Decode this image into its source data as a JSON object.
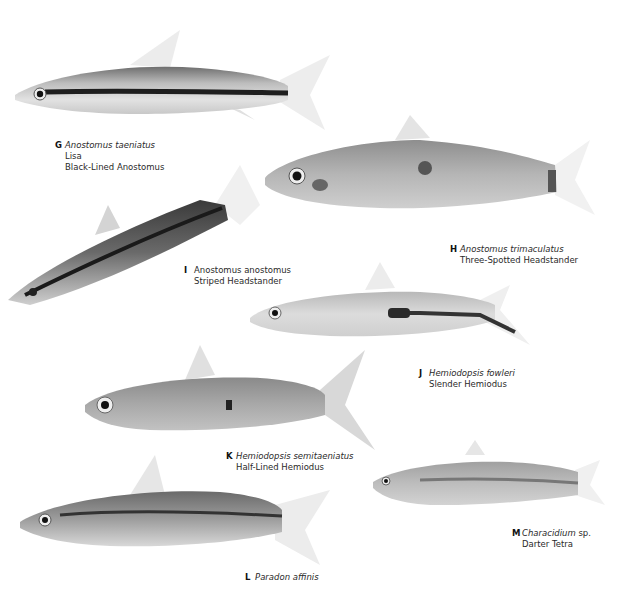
{
  "plate": {
    "specimens": [
      {
        "letter": "G",
        "scientific": "Anostomus taeniatus",
        "common": [
          "Lisa",
          "Black-Lined Anostomus"
        ]
      },
      {
        "letter": "H",
        "scientific": "Anostomus trimaculatus",
        "common": [
          "Three-Spotted Headstander"
        ]
      },
      {
        "letter": "I",
        "scientific": "Anostomus anostomus",
        "common": [
          "Striped Headstander"
        ]
      },
      {
        "letter": "J",
        "scientific": "Hemiodopsis fowleri",
        "common": [
          "Slender Hemiodus"
        ]
      },
      {
        "letter": "K",
        "scientific": "Hemiodopsis semitaeniatus",
        "common": [
          "Half-Lined Hemiodus"
        ]
      },
      {
        "letter": "L",
        "scientific": "Paradon affinis",
        "common": []
      },
      {
        "letter": "M",
        "scientific": "Characidium",
        "sci_suffix": " sp.",
        "common": [
          "Darter Tetra"
        ]
      }
    ]
  }
}
